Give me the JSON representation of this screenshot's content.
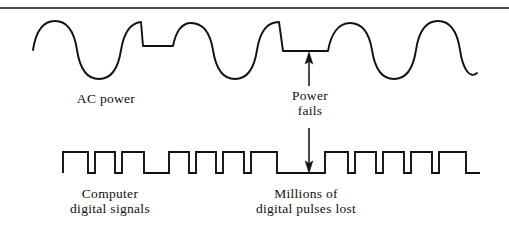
{
  "figure": {
    "background_color": "#ffffff",
    "stroke_color": "#111111",
    "top_rule": {
      "name": "top-horizontal-rule",
      "y": 8,
      "thickness": 1.6
    }
  },
  "labels": {
    "ac_power": {
      "lines": [
        "AC  power"
      ],
      "line1": "AC  power"
    },
    "power_fails": {
      "lines": [
        "Power",
        "fails"
      ],
      "line1": "Power",
      "line2": "fails"
    },
    "computer_digital_signals": {
      "lines": [
        "Computer",
        "digital  signals"
      ],
      "line1": "Computer",
      "line2": "digital  signals"
    },
    "millions_of_pulses_lost": {
      "lines": [
        "Millions  of",
        "digital  pulses  lost"
      ],
      "line1": "Millions  of",
      "line2": "digital  pulses  lost"
    }
  },
  "waveforms": {
    "ac_power": {
      "name": "ac-power-sine-wave",
      "description": "Sinusoidal AC mains waveform with a short brownout dip and a longer flat power-failure segment",
      "baseline_y": 50,
      "peak_y": 22,
      "trough_y": 78,
      "x_start": 33,
      "x_end": 477,
      "flat_segments": [
        {
          "name": "brownout-dip",
          "x_start": 143,
          "x_end": 173,
          "y": 46
        },
        {
          "name": "power-failure-flat",
          "x_start": 283,
          "x_end": 328,
          "y": 51
        }
      ]
    },
    "digital_signals": {
      "name": "digital-pulse-train",
      "description": "Square-wave digital pulse train with a wide low gap where pulses are lost",
      "high_y": 152,
      "low_y": 173,
      "x_start": 63,
      "x_end": 480,
      "lost_pulse_gap": {
        "x_start": 277,
        "x_end": 325
      }
    }
  },
  "annotation": {
    "power_fail_arrow": {
      "name": "power-fails-double-arrow",
      "x": 309,
      "y_top": 52,
      "y_bottom": 173,
      "heads": "both"
    }
  }
}
